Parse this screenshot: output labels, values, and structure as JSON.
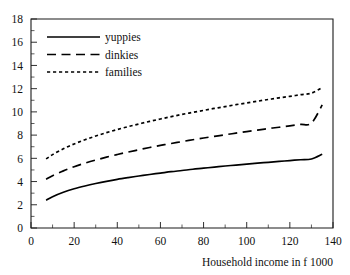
{
  "chart_data": {
    "type": "line",
    "title": "",
    "xlabel": "Household income in f 1000",
    "ylabel": "",
    "xlim": [
      0,
      140
    ],
    "ylim": [
      0,
      18
    ],
    "xticks": [
      0,
      20,
      40,
      60,
      80,
      100,
      120,
      140
    ],
    "yticks": [
      0,
      2,
      4,
      6,
      8,
      10,
      12,
      14,
      16,
      18
    ],
    "xtick_labels": [
      "0",
      "20",
      "40",
      "60",
      "80",
      "100",
      "120",
      "140"
    ],
    "ytick_labels": [
      "0",
      "2",
      "4",
      "6",
      "8",
      "10",
      "12",
      "14",
      "16",
      "18"
    ],
    "x_minor_step": 10,
    "y_minor_step": 1,
    "grid": false,
    "legend_position": "top-left",
    "x": [
      7,
      10,
      15,
      20,
      25,
      30,
      35,
      40,
      45,
      50,
      55,
      60,
      65,
      70,
      75,
      80,
      85,
      90,
      95,
      100,
      105,
      110,
      115,
      120,
      125,
      130,
      135
    ],
    "series": [
      {
        "name": "yuppies",
        "style": "solid",
        "color": "#000000",
        "values": [
          2.4,
          2.7,
          3.08,
          3.38,
          3.62,
          3.83,
          4.02,
          4.19,
          4.34,
          4.48,
          4.61,
          4.73,
          4.85,
          4.95,
          5.06,
          5.15,
          5.25,
          5.34,
          5.42,
          5.5,
          5.58,
          5.66,
          5.73,
          5.81,
          5.88,
          5.94,
          6.35
        ]
      },
      {
        "name": "dinkies",
        "style": "long-dash",
        "color": "#000000",
        "values": [
          4.2,
          4.5,
          4.92,
          5.28,
          5.58,
          5.85,
          6.1,
          6.33,
          6.54,
          6.74,
          6.93,
          7.11,
          7.28,
          7.44,
          7.6,
          7.75,
          7.89,
          8.03,
          8.17,
          8.3,
          8.43,
          8.56,
          8.68,
          8.8,
          8.92,
          9.03,
          10.6
        ]
      },
      {
        "name": "families",
        "style": "short-dash",
        "color": "#000000",
        "values": [
          5.95,
          6.32,
          6.82,
          7.24,
          7.6,
          7.92,
          8.21,
          8.48,
          8.73,
          8.96,
          9.18,
          9.39,
          9.59,
          9.78,
          9.96,
          10.13,
          10.3,
          10.46,
          10.62,
          10.77,
          10.92,
          11.07,
          11.21,
          11.34,
          11.48,
          11.61,
          12.1
        ]
      }
    ],
    "legend": [
      {
        "label": "yuppies",
        "style": "solid"
      },
      {
        "label": "dinkies",
        "style": "long-dash"
      },
      {
        "label": "families",
        "style": "short-dash"
      }
    ]
  }
}
